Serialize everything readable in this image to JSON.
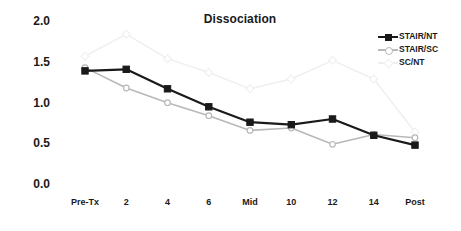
{
  "chart_data": {
    "type": "line",
    "title": "Dissociation",
    "xlabel": "",
    "ylabel": "",
    "categories": [
      "Pre-Tx",
      "2",
      "4",
      "6",
      "Mid",
      "10",
      "12",
      "14",
      "Post"
    ],
    "ylim": [
      0.0,
      2.0
    ],
    "y_ticks": [
      "0.0",
      "0.5",
      "1.0",
      "1.5",
      "2.0"
    ],
    "y_tick_values": [
      0.0,
      0.5,
      1.0,
      1.5,
      2.0
    ],
    "grid": false,
    "legend_position": "top-right",
    "series": [
      {
        "name": "STAIR/NT",
        "color": "#1a1a1a",
        "marker": "filled-square",
        "values": [
          1.4,
          1.42,
          1.18,
          0.96,
          0.77,
          0.74,
          0.81,
          0.61,
          0.49
        ]
      },
      {
        "name": "STAIR/SC",
        "color": "#b8b8b8",
        "marker": "open-circle",
        "values": [
          1.44,
          1.19,
          1.01,
          0.85,
          0.67,
          0.7,
          0.5,
          0.62,
          0.58
        ]
      },
      {
        "name": "SC/NT",
        "color": "#efefef",
        "marker": "open-diamond",
        "values": [
          1.58,
          1.85,
          1.55,
          1.38,
          1.18,
          1.3,
          1.53,
          1.3,
          0.65
        ]
      }
    ]
  },
  "legend": {
    "items": [
      {
        "label": "STAIR/NT"
      },
      {
        "label": "STAIR/SC"
      },
      {
        "label": "SC/NT"
      }
    ]
  }
}
